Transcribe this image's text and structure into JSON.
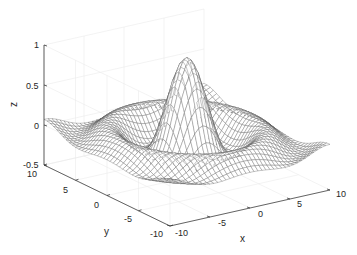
{
  "chart_data": {
    "type": "mesh3d",
    "title": "",
    "function": "z = sin(r)/r, r = sqrt(x^2 + y^2)",
    "xlabel": "x",
    "ylabel": "y",
    "zlabel": "z",
    "xlim": [
      -10,
      10
    ],
    "ylim": [
      -10,
      10
    ],
    "zlim": [
      -0.5,
      1
    ],
    "xticks": [
      -10,
      -5,
      0,
      5,
      10
    ],
    "yticks": [
      -10,
      -5,
      0,
      5,
      10
    ],
    "zticks": [
      -0.5,
      0,
      0.5,
      1
    ],
    "xtick_labels": [
      "-10",
      "-5",
      "0",
      "5",
      "10"
    ],
    "ytick_labels": [
      "-10",
      "-5",
      "0",
      "5",
      "10"
    ],
    "ztick_labels": [
      "-0.5",
      "0",
      "0.5",
      "1"
    ],
    "grid": true,
    "mesh_resolution": 41,
    "mesh_color": "#5a5a5a",
    "axis_color": "#262626",
    "grid_color": "#ebebeb",
    "view": "default 3D (az -37.5, el 30)"
  }
}
